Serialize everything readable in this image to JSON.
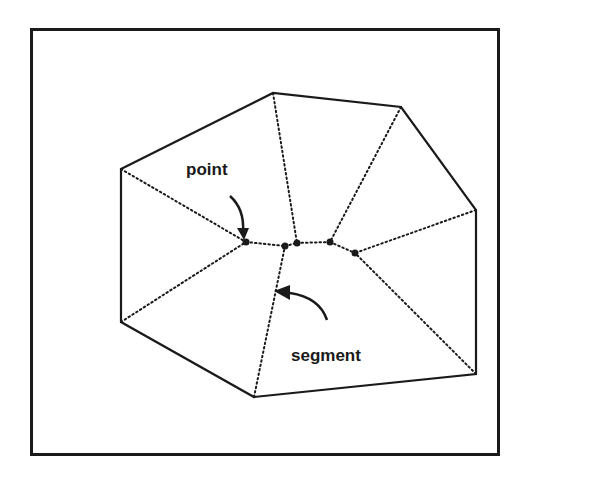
{
  "background_text": [
    {
      "text": "d the limit of a generalized polygon with",
      "x": 510,
      "y": 0
    },
    {
      "text": "of discs becomes infinite",
      "x": 510,
      "y": 20
    },
    {
      "text": "We will call each segment of the",
      "x": 510,
      "y": 120
    },
    {
      "text": "how rays correspond to the central",
      "x": 510,
      "y": 262
    },
    {
      "text": "the polygon into regions according to",
      "x": 510,
      "y": 290
    },
    {
      "text": "polygon sides. We define them as the set of",
      "x": 510,
      "y": 318
    },
    {
      "text": "inner polygon point that lie at the same distance",
      "x": 510,
      "y": 346
    }
  ],
  "figure": {
    "labels": {
      "point": "point",
      "segment": "segment"
    },
    "polygon_vertices": [
      [
        121,
        169
      ],
      [
        273,
        93
      ],
      [
        401,
        107
      ],
      [
        476,
        210
      ],
      [
        476,
        374
      ],
      [
        254,
        397
      ],
      [
        121,
        322
      ]
    ],
    "skeleton_points": [
      [
        246,
        242
      ],
      [
        285,
        246
      ],
      [
        297,
        243
      ],
      [
        330,
        242
      ],
      [
        355,
        253
      ]
    ],
    "stroke_color": "#1a1a1a"
  }
}
